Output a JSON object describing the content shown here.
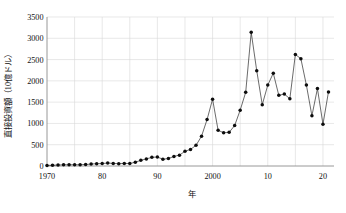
{
  "chart_data": {
    "type": "line",
    "title": "",
    "subtitle": "",
    "xlabel": "年",
    "ylabel": "直接投資額（10億ドル）",
    "xlim": [
      1970,
      2022
    ],
    "ylim": [
      0,
      3500
    ],
    "ytick_values": [
      0,
      500,
      1000,
      1500,
      2000,
      2500,
      3000,
      3500
    ],
    "ytick_labels": [
      "0",
      "500",
      "1000",
      "1500",
      "2000",
      "2500",
      "3000",
      "3500"
    ],
    "xtick_values": [
      1970,
      1980,
      1990,
      2000,
      2010,
      2020
    ],
    "xtick_labels": [
      "1970",
      "80",
      "90",
      "2000",
      "10",
      "20"
    ],
    "grid": {
      "horizontal": true,
      "vertical": true,
      "vertical_step": 5
    },
    "legend": {
      "show": false,
      "position": "none"
    },
    "marker": "filled-circle",
    "series": [
      {
        "name": "直接投資額",
        "x": [
          1970,
          1971,
          1972,
          1973,
          1974,
          1975,
          1976,
          1977,
          1978,
          1979,
          1980,
          1981,
          1982,
          1983,
          1984,
          1985,
          1986,
          1987,
          1988,
          1989,
          1990,
          1991,
          1992,
          1993,
          1994,
          1995,
          1996,
          1997,
          1998,
          1999,
          2000,
          2001,
          2002,
          2003,
          2004,
          2005,
          2006,
          2007,
          2008,
          2009,
          2010,
          2011,
          2012,
          2013,
          2014,
          2015,
          2016,
          2017,
          2018,
          2019,
          2020,
          2021
        ],
        "values": [
          13,
          18,
          22,
          28,
          30,
          28,
          30,
          35,
          45,
          55,
          57,
          70,
          60,
          55,
          60,
          58,
          88,
          135,
          165,
          205,
          210,
          160,
          175,
          225,
          255,
          345,
          390,
          485,
          700,
          1090,
          1570,
          840,
          780,
          790,
          950,
          1310,
          1730,
          3140,
          2240,
          1440,
          1900,
          2180,
          1660,
          1690,
          1580,
          2620,
          2520,
          1900,
          1180,
          1820,
          980,
          1740
        ]
      }
    ]
  }
}
